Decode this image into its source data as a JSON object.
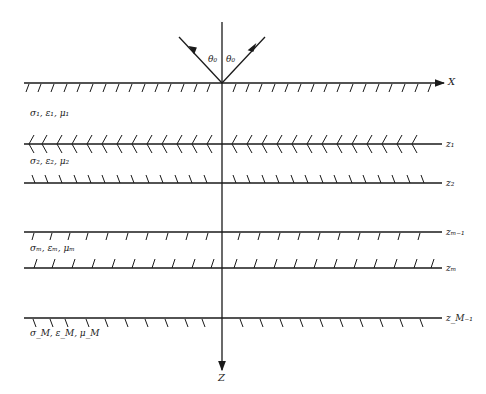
{
  "diagram": {
    "axis_x_label": "X",
    "axis_z_label": "Z",
    "incidence_angle_label_left": "θ₀",
    "incidence_angle_label_right": "θ₀",
    "interfaces": [
      {
        "id": "surface",
        "label": "X",
        "y": 83,
        "hatch": "top"
      },
      {
        "id": "z1",
        "label": "z₁",
        "y": 144,
        "hatch": "double"
      },
      {
        "id": "z2",
        "label": "z₂",
        "y": 183,
        "hatch": "above"
      },
      {
        "id": "zm-1",
        "label": "zₘ₋₁",
        "y": 232,
        "hatch": "below"
      },
      {
        "id": "zm",
        "label": "zₘ",
        "y": 268,
        "hatch": "above"
      },
      {
        "id": "zM-1",
        "label": "z_M₋₁",
        "y": 318,
        "hatch": "below"
      }
    ],
    "layers": [
      {
        "label": "σ₁, ε₁, μ₁"
      },
      {
        "label": "σ₂, ε₂, μ₂"
      },
      {
        "label": "σₘ, εₘ, μₘ"
      },
      {
        "label": "σ_M, ε_M, μ_M"
      }
    ],
    "colors": {
      "line": "#1a1a1a",
      "background": "#ffffff"
    }
  }
}
